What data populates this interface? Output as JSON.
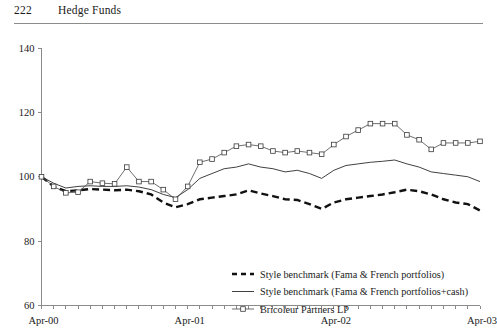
{
  "page": {
    "folio": "222",
    "running_title": "Hedge Funds"
  },
  "chart_data": {
    "type": "line",
    "title": "",
    "subtitle": "",
    "xlabel": "",
    "ylabel": "",
    "ylim": [
      60,
      140
    ],
    "yticks": [
      60,
      80,
      100,
      120,
      140
    ],
    "xtick_labels": [
      "Apr-00",
      "Apr-01",
      "Apr-02",
      "Apr-03"
    ],
    "xtick_positions": [
      0,
      12,
      24,
      36
    ],
    "grid": false,
    "legend_position": "inside-lower-center",
    "x": [
      "Apr-00",
      "May-00",
      "Jun-00",
      "Jul-00",
      "Aug-00",
      "Sep-00",
      "Oct-00",
      "Nov-00",
      "Dec-00",
      "Jan-01",
      "Feb-01",
      "Mar-01",
      "Apr-01",
      "May-01",
      "Jun-01",
      "Jul-01",
      "Aug-01",
      "Sep-01",
      "Oct-01",
      "Nov-01",
      "Dec-01",
      "Jan-02",
      "Feb-02",
      "Mar-02",
      "Apr-02",
      "May-02",
      "Jun-02",
      "Jul-02",
      "Aug-02",
      "Sep-02",
      "Oct-02",
      "Nov-02",
      "Dec-02",
      "Jan-03",
      "Feb-03",
      "Mar-03",
      "Apr-03"
    ],
    "series": [
      {
        "name": "Style benchmark (Fama & French portfolios)",
        "style": "dashed",
        "marker": "none",
        "color": "#111111",
        "values": [
          100.0,
          97.0,
          95.5,
          95.8,
          96.2,
          96.0,
          95.8,
          96.0,
          95.5,
          94.5,
          92.0,
          90.5,
          91.5,
          93.0,
          93.5,
          94.0,
          94.5,
          95.8,
          94.8,
          94.0,
          93.0,
          92.8,
          91.5,
          90.0,
          92.0,
          93.0,
          93.5,
          94.0,
          94.5,
          95.2,
          96.0,
          95.5,
          94.5,
          93.0,
          92.0,
          91.5,
          89.5
        ]
      },
      {
        "name": "Style benchmark (Fama & French portfolios+cash)",
        "style": "solid",
        "marker": "none",
        "color": "#2b2b2b",
        "values": [
          100.0,
          98.0,
          96.5,
          97.0,
          97.2,
          97.0,
          97.0,
          97.2,
          96.8,
          96.0,
          94.5,
          93.5,
          96.0,
          99.5,
          101.0,
          102.5,
          103.0,
          104.0,
          103.0,
          102.5,
          101.5,
          102.0,
          101.0,
          99.5,
          102.0,
          103.5,
          104.0,
          104.5,
          104.8,
          105.2,
          104.0,
          103.0,
          101.5,
          101.0,
          100.5,
          100.0,
          98.5
        ]
      },
      {
        "name": "Bricoleur Partners LP",
        "style": "solid",
        "marker": "open-square",
        "color": "#4a4a4a",
        "values": [
          100.0,
          97.0,
          95.0,
          95.2,
          98.5,
          98.0,
          97.8,
          103.0,
          98.5,
          98.5,
          96.0,
          93.0,
          97.0,
          104.5,
          105.5,
          107.5,
          109.5,
          110.0,
          109.5,
          108.0,
          107.5,
          108.0,
          107.5,
          107.0,
          110.0,
          112.5,
          114.5,
          116.5,
          116.5,
          116.5,
          113.0,
          111.5,
          108.5,
          110.5,
          110.5,
          110.5,
          111.0
        ]
      }
    ],
    "legend": [
      {
        "label": "Style benchmark (Fama & French portfolios)",
        "style": "dashed"
      },
      {
        "label": "Style benchmark (Fama & French portfolios+cash)",
        "style": "solid"
      },
      {
        "label": "Bricoleur Partners LP",
        "style": "solid-marker"
      }
    ]
  }
}
